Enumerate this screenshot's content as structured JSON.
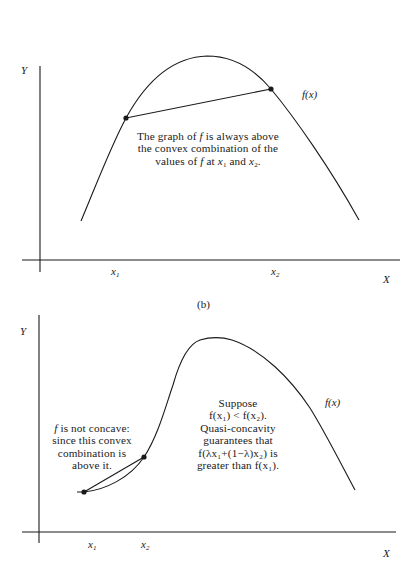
{
  "panel_a": {
    "y_axis_label": "Y",
    "x_axis_label": "X",
    "curve_label": "f(x)",
    "x1_label": "x",
    "x1_sub": "1",
    "x2_label": "x",
    "x2_sub": "2",
    "note_lines": [
      "The graph of f is always above",
      "the convex combination of the",
      "values of f at x₁ and x₂."
    ],
    "note": {
      "line1_a": "The graph of ",
      "line1_f": "f",
      "line1_b": " is always above",
      "line2": "the convex combination of the",
      "line3_a": "values of ",
      "line3_f": "f",
      "line3_b": " at ",
      "line3_x1": "x",
      "line3_x1_sub": "1",
      "line3_c": " and ",
      "line3_x2": "x",
      "line3_x2_sub": "2",
      "line3_d": "."
    }
  },
  "panel_b": {
    "caption": "(b)",
    "y_axis_label": "Y",
    "x_axis_label": "X",
    "curve_label": "f(x)",
    "x1_label": "x",
    "x1_sub": "1",
    "x2_label": "x",
    "x2_sub": "2",
    "left_note": {
      "line1_f": "f",
      "line1_b": " is not concave:",
      "line2": "since this convex",
      "line3": "combination is",
      "line4": "above it."
    },
    "right_note": {
      "line1": "Suppose",
      "line2": "f(x₁) < f(x₂).",
      "line3": "Quasi-concavity",
      "line4": "guarantees that",
      "line5": "f(λx₁+(1−λ)x₂) is",
      "line6": "greater than f(x₁)."
    }
  }
}
